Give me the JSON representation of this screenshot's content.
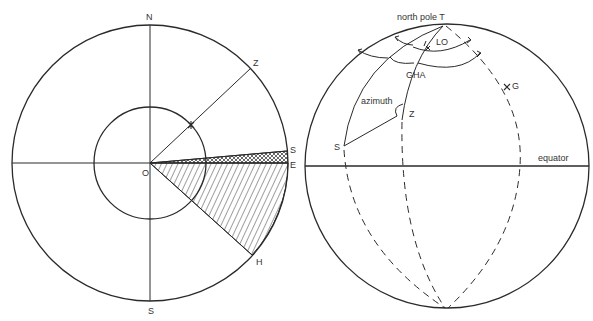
{
  "left_diagram": {
    "labels": {
      "north": "N",
      "zenith": "Z",
      "sun": "S",
      "east": "E",
      "center": "O",
      "h_point": "H",
      "south": "S"
    }
  },
  "right_diagram": {
    "labels": {
      "north_pole": "north pole  T",
      "lo": "LO",
      "gha": "GHA",
      "g_point": "G",
      "azimuth": "azimuth",
      "zenith": "Z",
      "sun": "S",
      "equator": "equator"
    }
  },
  "colors": {
    "ink": "#2a2a2a",
    "background": "#ffffff"
  }
}
